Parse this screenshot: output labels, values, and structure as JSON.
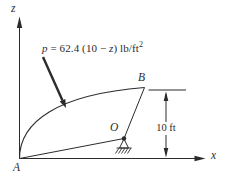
{
  "diagram": {
    "pressure_equation": {
      "var_p": "p",
      "middle": " = 62.4 (10 − ",
      "var_z": "z",
      "tail": ") lb/ft",
      "exponent": "2"
    },
    "axes": {
      "z_label": "z",
      "x_label": "x"
    },
    "points": {
      "a_label": "A",
      "b_label": "B",
      "o_label": "O"
    },
    "dimension": {
      "label": "10 ft"
    },
    "colors": {
      "ink": "#2b2b2b",
      "background": "#ffffff"
    }
  }
}
